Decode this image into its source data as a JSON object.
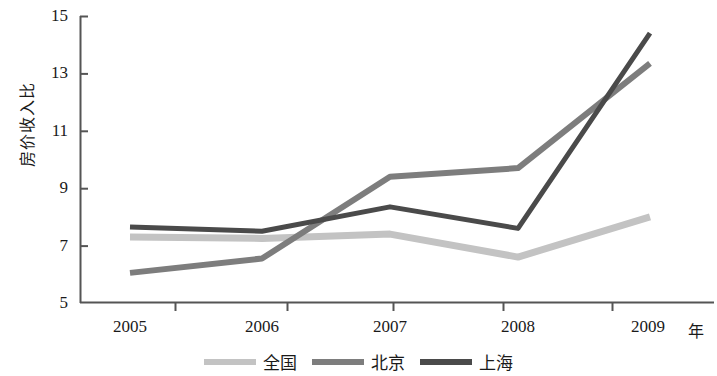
{
  "chart_data": {
    "type": "line",
    "title": "",
    "xlabel": "年",
    "ylabel": "房价收入比",
    "x": [
      "2005",
      "2006",
      "2007",
      "2008",
      "2009"
    ],
    "categories": [
      "2005",
      "2006",
      "2007",
      "2008",
      "2009"
    ],
    "xticklabels": [
      "2005",
      "2006",
      "2007",
      "2008",
      "2009"
    ],
    "yticklabels": [
      "15",
      "13",
      "11",
      "9",
      "7",
      "5"
    ],
    "yticks": [
      15,
      13,
      11,
      9,
      7,
      5
    ],
    "ylim": [
      5,
      15
    ],
    "grid": false,
    "legend_position": "bottom-center",
    "series": [
      {
        "name": "全国",
        "values": [
          7.3,
          7.25,
          7.4,
          6.6,
          8.0
        ],
        "color": "#c3c3c3"
      },
      {
        "name": "北京",
        "values": [
          6.05,
          6.55,
          9.4,
          9.7,
          13.35
        ],
        "color": "#7d7d7d"
      },
      {
        "name": "上海",
        "values": [
          7.65,
          7.5,
          8.35,
          7.6,
          14.4
        ],
        "color": "#4a4a4a"
      }
    ]
  },
  "axes": {
    "y_title": "房价收入比",
    "x_unit": "年",
    "y_ticks": [
      "15",
      "13",
      "11",
      "9",
      "7",
      "5"
    ],
    "x_ticks": [
      "2005",
      "2006",
      "2007",
      "2008",
      "2009"
    ],
    "axis_color": "#555555"
  },
  "legend": {
    "items": [
      {
        "label": "全国",
        "color": "#c3c3c3"
      },
      {
        "label": "北京",
        "color": "#7d7d7d"
      },
      {
        "label": "上海",
        "color": "#4a4a4a"
      }
    ]
  }
}
